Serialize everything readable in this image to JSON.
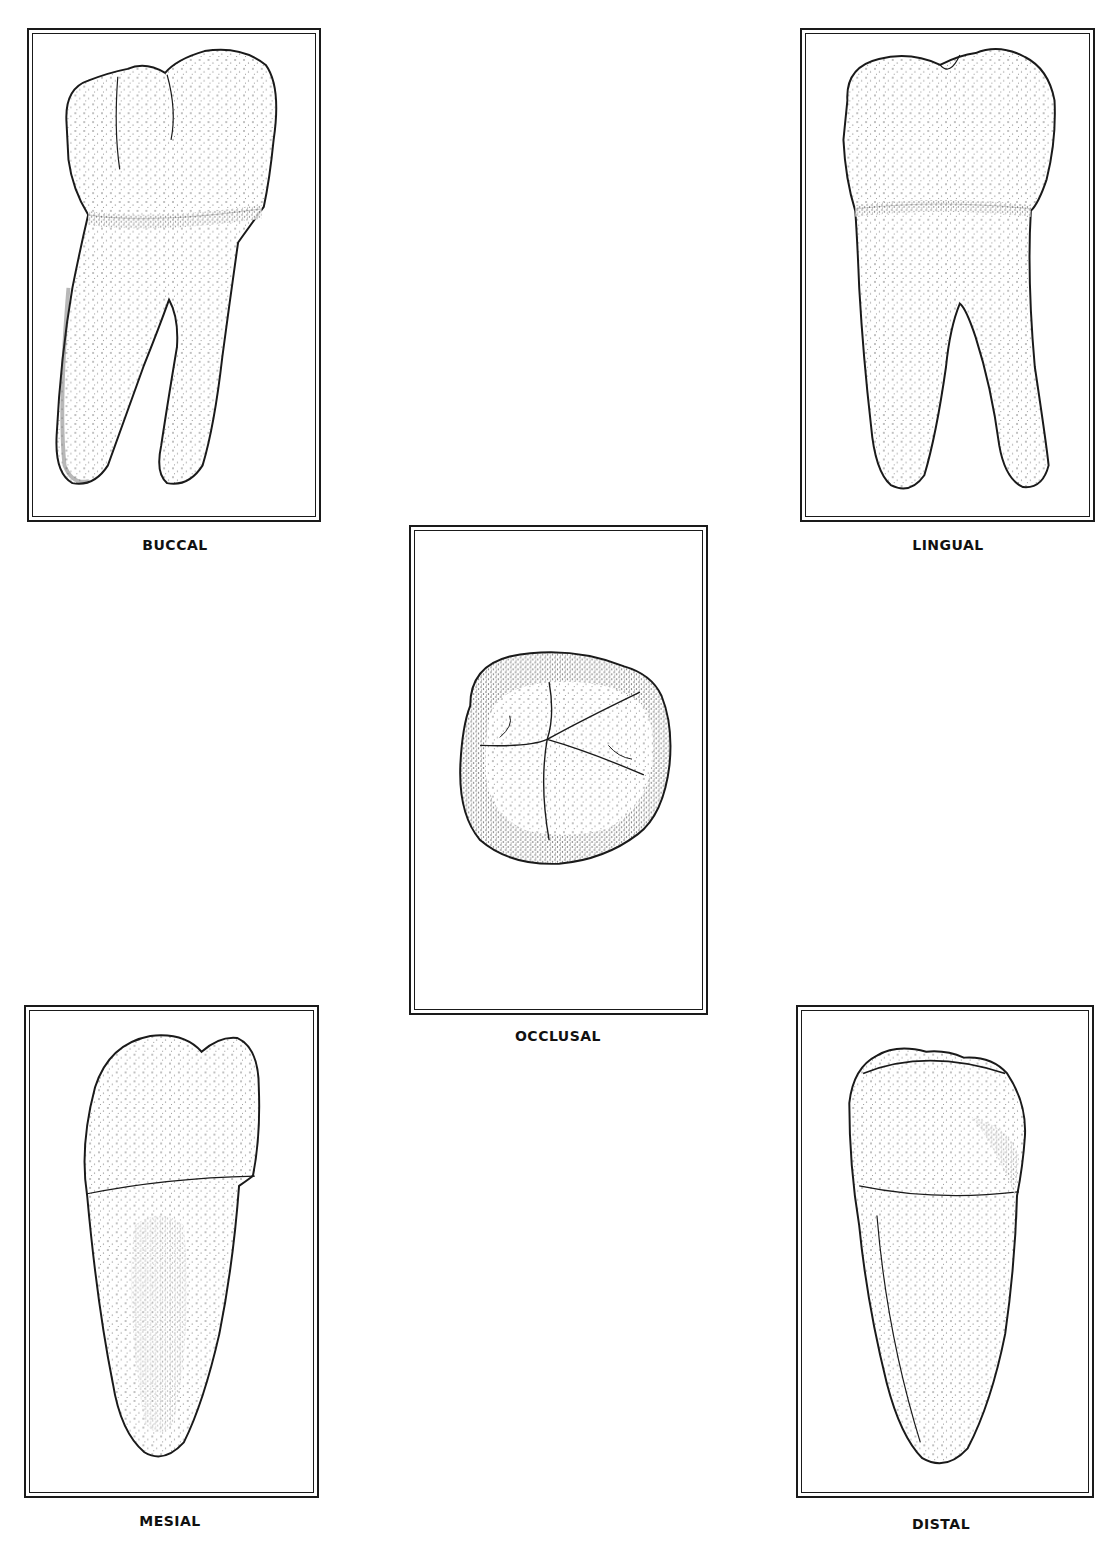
{
  "figure": {
    "type": "tooth-views",
    "views": [
      {
        "id": "buccal",
        "label": "BUCCAL"
      },
      {
        "id": "lingual",
        "label": "LINGUAL"
      },
      {
        "id": "occlusal",
        "label": "OCCLUSAL"
      },
      {
        "id": "mesial",
        "label": "MESIAL"
      },
      {
        "id": "distal",
        "label": "DISTAL"
      }
    ]
  },
  "colors": {
    "ink": "#1a1a1a",
    "stipple": "#555555",
    "background": "#ffffff"
  }
}
